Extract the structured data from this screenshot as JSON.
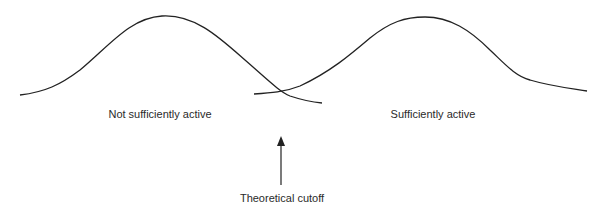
{
  "diagram": {
    "curves": [
      {
        "name": "not-sufficiently-active",
        "label": "Not sufficiently active"
      },
      {
        "name": "sufficiently-active",
        "label": "Sufficiently active"
      }
    ],
    "cutoff": {
      "label": "Theoretical cutoff"
    },
    "colors": {
      "line": "#222222",
      "text": "#2a2a2a"
    }
  }
}
